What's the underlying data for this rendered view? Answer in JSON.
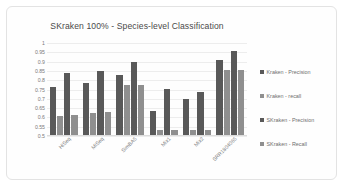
{
  "chart_data": {
    "type": "bar",
    "title": "SKraken 100% - Species-level Classification",
    "xlabel": "",
    "ylabel": "",
    "ylim": [
      0.5,
      1
    ],
    "ytick_step": 0.05,
    "yticks": [
      "1",
      "0.95",
      "0.9",
      "0.85",
      "0.8",
      "0.75",
      "0.7",
      "0.65",
      "0.6",
      "0.55",
      "0.5"
    ],
    "grid": true,
    "legend_position": "right",
    "categories": [
      "HiSeq",
      "MiSeq",
      "SimBA5",
      "Mix1",
      "Mix2",
      "SRR1804065"
    ],
    "series": [
      {
        "name": "Kraken - Precision",
        "color": "#595959",
        "values": [
          0.765,
          0.785,
          0.83,
          0.635,
          0.7,
          0.91
        ]
      },
      {
        "name": "Kraken - recall",
        "color": "#8f8f8f",
        "values": [
          0.605,
          0.625,
          0.775,
          0.535,
          0.535,
          0.855
        ]
      },
      {
        "name": "SKraken - Precision",
        "color": "#595959",
        "values": [
          0.84,
          0.852,
          0.9,
          0.755,
          0.735,
          0.955
        ]
      },
      {
        "name": "SKraken - Recall",
        "color": "#8f8f8f",
        "values": [
          0.612,
          0.63,
          0.775,
          0.535,
          0.535,
          0.855
        ]
      }
    ]
  }
}
